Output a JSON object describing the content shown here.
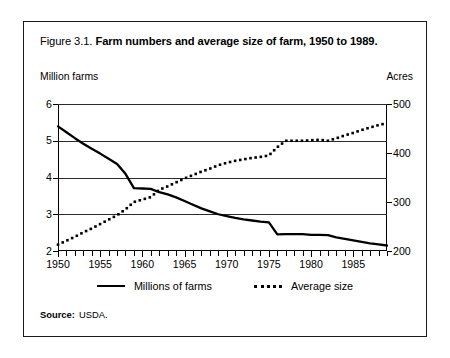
{
  "figure": {
    "number": "Figure 3.1.",
    "caption": "Farm numbers and average size of farm, 1950 to 1989."
  },
  "source": {
    "label": "Source:",
    "value": "USDA."
  },
  "legend": {
    "items": [
      {
        "label": "Millions of farms",
        "marker": "solid-line-swatch"
      },
      {
        "label": "Average size",
        "marker": "dotted-line-swatch"
      }
    ]
  },
  "chart_data": {
    "type": "line",
    "title": "Farm numbers and average size of farm, 1950 to 1989",
    "xlabel": "",
    "ylabel": "Million farms",
    "y2label": "Acres",
    "xlim": [
      1950,
      1989
    ],
    "ylim": [
      2,
      6
    ],
    "y2lim": [
      200,
      500
    ],
    "grid": true,
    "legend_position": "bottom-center",
    "x_major_ticks": [
      1950,
      1955,
      1960,
      1965,
      1970,
      1975,
      1980,
      1985
    ],
    "x_tick_labels": [
      "1950",
      "1955",
      "1960",
      "1965",
      "1970",
      "1975",
      "1980",
      "1985"
    ],
    "x_minor_tick_interval": 1,
    "y_ticks": [
      2,
      3,
      4,
      5,
      6
    ],
    "y_tick_labels": [
      "2",
      "3",
      "4",
      "5",
      "6"
    ],
    "y2_ticks": [
      200,
      300,
      400,
      500
    ],
    "y2_tick_labels": [
      "200",
      "300",
      "400",
      "500"
    ],
    "x": [
      1950,
      1951,
      1952,
      1953,
      1954,
      1955,
      1956,
      1957,
      1958,
      1959,
      1960,
      1961,
      1962,
      1963,
      1964,
      1965,
      1966,
      1967,
      1968,
      1969,
      1970,
      1971,
      1972,
      1973,
      1974,
      1975,
      1976,
      1977,
      1978,
      1979,
      1980,
      1981,
      1982,
      1983,
      1984,
      1985,
      1986,
      1987,
      1988,
      1989
    ],
    "series": [
      {
        "name": "Millions of farms",
        "axis": "left",
        "style": "solid",
        "units": "million farms",
        "values": [
          5.39,
          5.23,
          5.07,
          4.92,
          4.78,
          4.65,
          4.51,
          4.37,
          4.1,
          3.71,
          3.7,
          3.69,
          3.6,
          3.54,
          3.46,
          3.36,
          3.26,
          3.16,
          3.08,
          3.0,
          2.95,
          2.9,
          2.86,
          2.83,
          2.8,
          2.78,
          2.45,
          2.46,
          2.46,
          2.46,
          2.44,
          2.44,
          2.43,
          2.37,
          2.33,
          2.29,
          2.25,
          2.21,
          2.18,
          2.15
        ]
      },
      {
        "name": "Average size",
        "axis": "right",
        "style": "dotted",
        "units": "acres",
        "values": [
          213,
          221,
          229,
          238,
          246,
          255,
          264,
          273,
          285,
          300,
          305,
          310,
          325,
          332,
          340,
          348,
          355,
          362,
          368,
          375,
          380,
          384,
          387,
          390,
          392,
          395,
          412,
          425,
          425,
          425,
          426,
          427,
          425,
          430,
          436,
          441,
          447,
          452,
          457,
          461
        ]
      }
    ],
    "annotations": [
      {
        "text": "series cross near 1962 at ~3.6 million farms / ~325 acres"
      },
      {
        "text": "sharp step drop in farm numbers between 1975 and 1976"
      },
      {
        "text": "average size plateaus near 425 acres from 1977 to 1982"
      }
    ]
  }
}
